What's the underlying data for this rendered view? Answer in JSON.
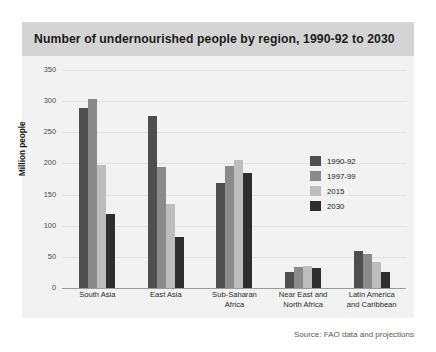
{
  "title": "Number of undernourished people by region, 1990-92 to 2030",
  "source": "Source: FAO data and projections",
  "colors": {
    "banner": "#d4d4d4",
    "panel": "#f2f2f2",
    "series_1990_92": "#4f4f4f",
    "series_1997_99": "#8a8a8a",
    "series_2015": "#bdbdbd",
    "series_2030": "#2e2e2e"
  },
  "chart_data": {
    "type": "bar",
    "title": "Number of undernourished people by region, 1990-92 to 2030",
    "xlabel": "",
    "ylabel": "Million people",
    "ylim": [
      0,
      350
    ],
    "yticks": [
      0,
      50,
      100,
      150,
      200,
      250,
      300,
      350
    ],
    "grid": true,
    "legend_position": "inside-top-right",
    "categories": [
      "South Asia",
      "East Asia",
      "Sub-Saharan Africa",
      "Near East and North Africa",
      "Latin America and Caribbean"
    ],
    "category_lines": [
      [
        "South Asia"
      ],
      [
        "East Asia"
      ],
      [
        "Sub-Saharan",
        "Africa"
      ],
      [
        "Near East and",
        "North Africa"
      ],
      [
        "Latin America",
        "and Caribbean"
      ]
    ],
    "series": [
      {
        "name": "1990-92",
        "color": "#4f4f4f",
        "values": [
          289,
          276,
          168,
          25,
          59
        ]
      },
      {
        "name": "1997-99",
        "color": "#8a8a8a",
        "values": [
          304,
          194,
          196,
          33,
          54
        ]
      },
      {
        "name": "2015",
        "color": "#bdbdbd",
        "values": [
          197,
          135,
          206,
          36,
          41
        ]
      },
      {
        "name": "2030",
        "color": "#2e2e2e",
        "values": [
          119,
          82,
          184,
          32,
          25
        ]
      }
    ],
    "annotation": "Source: FAO data and projections"
  }
}
